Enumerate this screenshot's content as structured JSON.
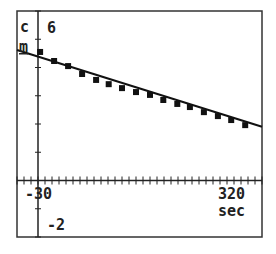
{
  "chart_data": {
    "type": "scatter",
    "title": "",
    "xlabel": "sec",
    "ylabel": "cm",
    "xlim": [
      -30,
      320
    ],
    "ylim": [
      -2,
      6
    ],
    "x_tick_labels": [
      "-30",
      "320"
    ],
    "y_tick_labels": [
      "6",
      "-2"
    ],
    "x_tick_step": 10,
    "y_tick_step": 1,
    "grid": false,
    "legend": null,
    "series": [
      {
        "name": "data",
        "style": "square-markers",
        "x": [
          3,
          23,
          43,
          63,
          83,
          101,
          120,
          140,
          160,
          179,
          199,
          217,
          237,
          257,
          276,
          296
        ],
        "y": [
          4.55,
          4.23,
          4.05,
          3.77,
          3.56,
          3.41,
          3.27,
          3.13,
          3.03,
          2.85,
          2.71,
          2.6,
          2.42,
          2.28,
          2.14,
          1.96
        ]
      },
      {
        "name": "fit",
        "style": "line",
        "x": [
          -30,
          320
        ],
        "y": [
          4.62,
          1.9
        ]
      }
    ]
  },
  "labels": {
    "y_top": "6",
    "y_bottom": "-2",
    "y_unit_c": "c",
    "y_unit_m": "m",
    "x_left": "-30",
    "x_right": "320",
    "x_unit": "sec"
  }
}
